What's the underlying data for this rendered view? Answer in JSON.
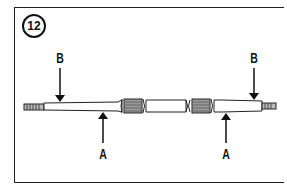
{
  "figure": {
    "step_number": "12",
    "labels": {
      "b_left": "B",
      "b_right": "B",
      "a_left": "A",
      "a_right": "A"
    },
    "colors": {
      "line": "#111111",
      "background": "#ffffff"
    }
  }
}
